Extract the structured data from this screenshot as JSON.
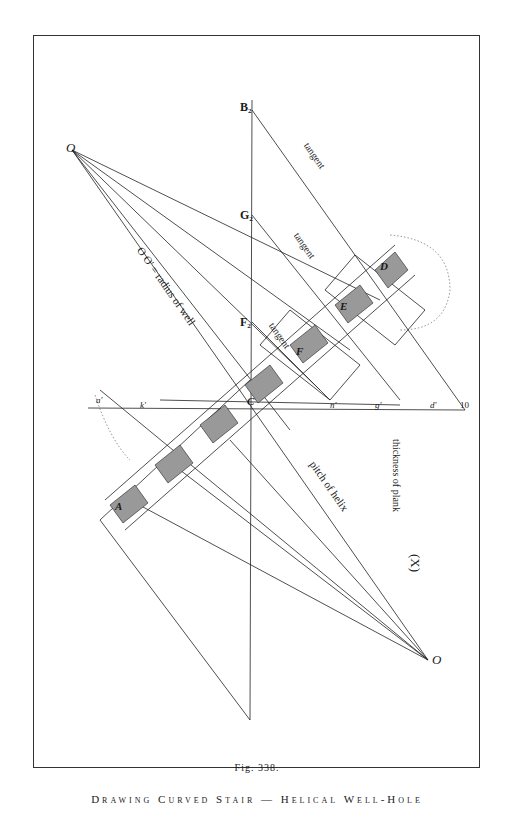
{
  "figure": {
    "label": "Fig. 338.",
    "caption": "Drawing Curved Stair — Helical Well-Hole"
  },
  "labels": {
    "O_top": "O",
    "O_bottom": "O",
    "B2": "B₂",
    "G2": "G₂",
    "F2": "F₂",
    "tangent1": "tangent",
    "tangent2": "tangent",
    "tangent3": "tangent",
    "radius": "O O' = radius of well",
    "pitch": "pitch of helix",
    "thickness": "thickness of plank",
    "X": "(X)",
    "A": "A",
    "C": "C",
    "D": "D",
    "E": "E",
    "F": "F",
    "a1": "a'",
    "k2": "k'",
    "s3": "s",
    "c4": "c'",
    "n5": "n'",
    "g6": "g'",
    "d7": "d'",
    "h8": "11",
    "n10": "10",
    "a_small": "a",
    "b_small": "b"
  }
}
